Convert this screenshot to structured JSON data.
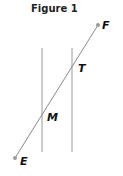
{
  "title": "Figure 1",
  "points": {
    "F": {
      "label": "F",
      "x": 98,
      "y": 25
    },
    "E": {
      "label": "E",
      "x": 15,
      "y": 158
    },
    "T": {
      "label": "T",
      "x": 72,
      "y": 64
    },
    "M": {
      "label": "M",
      "x": 42,
      "y": 112
    }
  },
  "colors": {
    "line": "#8a8a8a",
    "point": "#9a9a9a",
    "text": "#111111"
  }
}
